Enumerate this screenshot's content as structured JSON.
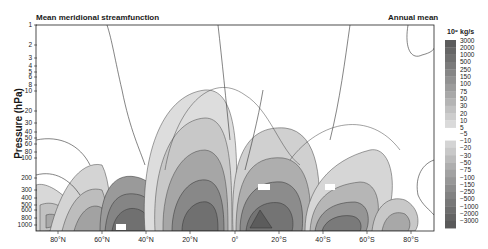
{
  "header": {
    "title_left": "Mean meridional streamfunction",
    "title_right": "Annual mean"
  },
  "colorbar": {
    "unit": "10⁹ kg/s",
    "positive_labels": [
      "3000",
      "2000",
      "1000",
      "500",
      "250",
      "150",
      "100",
      "75",
      "50",
      "30",
      "20",
      "10",
      "5"
    ],
    "negative_labels": [
      "−5",
      "−10",
      "−20",
      "−30",
      "−50",
      "−75",
      "−100",
      "−150",
      "−250",
      "−500",
      "−1000",
      "−2000",
      "−3000"
    ],
    "positive_colors": [
      "#5c5c5c",
      "#666666",
      "#707070",
      "#7b7b7b",
      "#868686",
      "#919191",
      "#9c9c9c",
      "#a8a8a8",
      "#b4b4b4",
      "#c1c1c1",
      "#cdcdcd",
      "#dadada"
    ],
    "negative_colors": [
      "#d4d4d4",
      "#c8c8c8",
      "#bbbbbb",
      "#aeaeae",
      "#a2a2a2",
      "#979797",
      "#8c8c8c",
      "#828282",
      "#787878",
      "#6e6e6e",
      "#646464",
      "#5a5a5a"
    ]
  },
  "chart_data": {
    "type": "heatmap",
    "title": "Mean meridional streamfunction",
    "subtitle": "Annual mean",
    "xlabel": "",
    "ylabel": "Pressure (hPa)",
    "colorbar_label": "10⁹ kg/s",
    "x_ticks": [
      "80°N",
      "60°N",
      "40°N",
      "20°N",
      "0°",
      "20°S",
      "40°S",
      "60°S",
      "80°S"
    ],
    "x_range": [
      "90°N",
      "90°S"
    ],
    "y_ticks": [
      1,
      2,
      3,
      4,
      5,
      6,
      8,
      10,
      20,
      30,
      40,
      50,
      60,
      80,
      100,
      200,
      300,
      400,
      500,
      600,
      800,
      1000
    ],
    "y_scale": "log",
    "y_range": [
      1000,
      1
    ],
    "contour_levels": [
      -3000,
      -2000,
      -1000,
      -500,
      -250,
      -150,
      -100,
      -75,
      -50,
      -30,
      -20,
      -10,
      -5,
      5,
      10,
      20,
      30,
      50,
      75,
      100,
      150,
      250,
      500,
      1000,
      2000,
      3000
    ],
    "cells": [
      {
        "name": "Northern Polar cell",
        "lat_center": "80°N",
        "sign": "negative",
        "peak_approx": -10
      },
      {
        "name": "Northern Ferrel cell",
        "lat_center": "50°N",
        "sign": "negative",
        "peak_approx": -30
      },
      {
        "name": "Northern Hadley cell",
        "lat_center": "15°N",
        "sign": "positive",
        "peak_approx": 100
      },
      {
        "name": "Southern Hadley cell",
        "lat_center": "15°S",
        "sign": "negative",
        "peak_approx": -100
      },
      {
        "name": "Southern Ferrel cell",
        "lat_center": "45°S",
        "sign": "positive",
        "peak_approx": 50
      },
      {
        "name": "Southern Polar cell",
        "lat_center": "75°S",
        "sign": "negative",
        "peak_approx": -10
      }
    ],
    "inline_labels": [
      "5",
      "10",
      "30",
      "-10",
      "-30",
      "100",
      "1000",
      "-30",
      "-100",
      "50",
      "-10",
      "10"
    ]
  },
  "axes": {
    "ylabel": "Pressure (hPa)",
    "y_ticks": [
      {
        "label": "1",
        "y": 25
      },
      {
        "label": "2",
        "y": 45
      },
      {
        "label": "3",
        "y": 58
      },
      {
        "label": "4",
        "y": 66
      },
      {
        "label": "5",
        "y": 72
      },
      {
        "label": "6",
        "y": 77
      },
      {
        "label": "8",
        "y": 85
      },
      {
        "label": "10",
        "y": 91
      },
      {
        "label": "20",
        "y": 111
      },
      {
        "label": "30",
        "y": 123
      },
      {
        "label": "40",
        "y": 132
      },
      {
        "label": "50",
        "y": 138
      },
      {
        "label": "60",
        "y": 144
      },
      {
        "label": "80",
        "y": 152
      },
      {
        "label": "100",
        "y": 158
      },
      {
        "label": "200",
        "y": 178
      },
      {
        "label": "300",
        "y": 190
      },
      {
        "label": "400",
        "y": 198
      },
      {
        "label": "500",
        "y": 205
      },
      {
        "label": "600",
        "y": 210
      },
      {
        "label": "800",
        "y": 218
      },
      {
        "label": "1000",
        "y": 225
      }
    ],
    "x_ticks": [
      {
        "label": "80°N",
        "x": 58
      },
      {
        "label": "60°N",
        "x": 102
      },
      {
        "label": "40°N",
        "x": 146
      },
      {
        "label": "20°N",
        "x": 190
      },
      {
        "label": "0°",
        "x": 235
      },
      {
        "label": "20°S",
        "x": 279
      },
      {
        "label": "40°S",
        "x": 323
      },
      {
        "label": "60°S",
        "x": 367
      },
      {
        "label": "80°S",
        "x": 411
      }
    ]
  }
}
